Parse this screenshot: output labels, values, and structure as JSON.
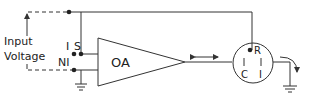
{
  "diagram": {
    "labels": {
      "input": "Input",
      "voltage": "Voltage",
      "inverting": "I",
      "signal": "S",
      "non_inverting": "NI",
      "amplifier": "OA",
      "reference": "R",
      "counter": "C",
      "indicator": "I"
    },
    "colors": {
      "line": "#333333",
      "background": "#ffffff"
    }
  }
}
